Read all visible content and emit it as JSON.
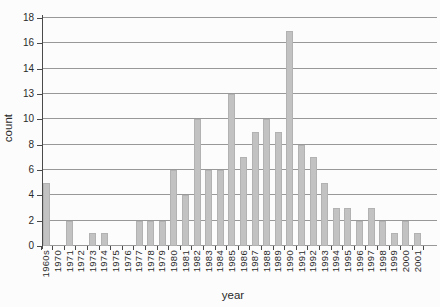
{
  "chart_data": {
    "type": "bar",
    "title": "",
    "xlabel": "year",
    "ylabel": "count",
    "categories": [
      "1960s",
      "1970",
      "1971",
      "1972",
      "1973",
      "1974",
      "1975",
      "1976",
      "1977",
      "1978",
      "1979",
      "1980",
      "1981",
      "1982",
      "1983",
      "1984",
      "1985",
      "1986",
      "1987",
      "1988",
      "1989",
      "1990",
      "1991",
      "1992",
      "1993",
      "1994",
      "1995",
      "1996",
      "1997",
      "1998",
      "1999",
      "2000",
      "2001"
    ],
    "values": [
      5,
      0,
      2,
      0,
      1,
      1,
      0,
      0,
      2,
      2,
      2,
      6,
      4,
      10,
      6,
      6,
      13,
      7,
      9,
      10,
      9,
      17,
      8,
      7,
      5,
      3,
      3,
      2,
      3,
      2,
      1,
      2,
      1
    ],
    "y_ticks": [
      "0",
      "2",
      "4",
      "6",
      "8",
      "10",
      "13",
      "14",
      "16",
      "18"
    ],
    "ylim": [
      0,
      18
    ],
    "grid": true,
    "legend": false,
    "colors": {
      "bar": "#c2c2c2",
      "bar_edge": "#b2b2b2",
      "gridline": "#989898",
      "axis": "#4a4a4a",
      "text": "#2a2a2a",
      "background": "#fcfcfc"
    }
  }
}
